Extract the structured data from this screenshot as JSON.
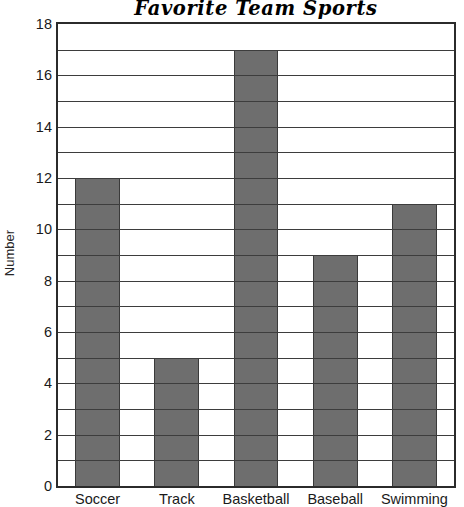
{
  "chart_data": {
    "type": "bar",
    "title": "Favorite Team Sports",
    "xlabel": "",
    "ylabel": "Number",
    "categories": [
      "Soccer",
      "Track",
      "Basketball",
      "Baseball",
      "Swimming"
    ],
    "values": [
      12,
      5,
      17,
      9,
      11
    ],
    "ylim": [
      0,
      18
    ],
    "ytick_labels": [
      "18",
      "16",
      "14",
      "12",
      "10",
      "8",
      "6",
      "4",
      "2",
      "0"
    ],
    "ytick_values": [
      18,
      16,
      14,
      12,
      10,
      8,
      6,
      4,
      2,
      0
    ],
    "ytick_step": 2,
    "gridline_step": 1,
    "grid": true,
    "legend": false,
    "bar_color": "#6e6e6e",
    "bar_edge_color": "#3a3a3a",
    "grid_color": "#3d3d3d",
    "axis_color": "#2b2b2b",
    "background_color": "#ffffff"
  }
}
